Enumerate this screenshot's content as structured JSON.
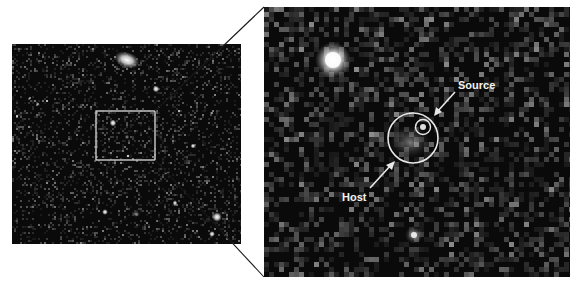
{
  "figure": {
    "colors": {
      "background": "#ffffff",
      "sky": "#0a0a0a",
      "annotation": "#e8e8e8",
      "connector": "#1a1a1a"
    },
    "left_panel": {
      "name": "wide-field-image",
      "zoom_box_label": ""
    },
    "right_panel": {
      "name": "zoomed-inset-image",
      "annotations": [
        {
          "id": "source",
          "label": "Source",
          "marker": "small-circle"
        },
        {
          "id": "host",
          "label": "Host",
          "marker": "large-circle"
        }
      ]
    }
  }
}
